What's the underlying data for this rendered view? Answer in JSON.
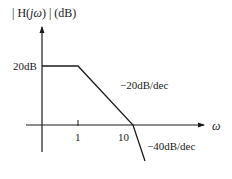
{
  "diagram": {
    "type": "bode-magnitude-asymptotic-plot",
    "y_axis_label": "| H(jω) | (dB)",
    "x_axis_label": "ω",
    "x_ticks": [
      "1",
      "10"
    ],
    "y_ticks": [
      "20dB"
    ],
    "segments": [
      {
        "from": "0",
        "to": "1",
        "slope_label": "",
        "description": "flat at 20dB"
      },
      {
        "from": "1",
        "to": "10",
        "slope_label": "−20dB/dec"
      },
      {
        "from": "10",
        "to": "",
        "slope_label": "−40dB/dec"
      }
    ],
    "colors": {
      "line": "#1a1a1a",
      "background": "#ffffff"
    }
  },
  "labels": {
    "ylabel_prefix": "| H(",
    "ylabel_j": "j",
    "ylabel_omega": "ω",
    "ylabel_suffix": ") | (dB)",
    "xlabel": "ω",
    "tick_1": "1",
    "tick_10": "10",
    "level_20db": "20dB",
    "slope_1": "−20dB/dec",
    "slope_2": "−40dB/dec"
  }
}
